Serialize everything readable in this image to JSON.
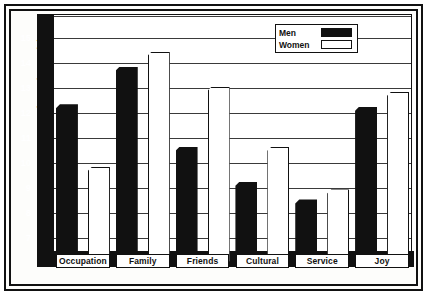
{
  "chart_data": {
    "type": "bar",
    "title": "",
    "xlabel": "",
    "ylabel": "Average Scores (21-point scale)",
    "categories": [
      "Occupation",
      "Family",
      "Friends",
      "Cultural",
      "Service",
      "Joy"
    ],
    "series": [
      {
        "name": "Men",
        "values": [
          12.3,
          13.8,
          10.6,
          9.2,
          8.5,
          12.2
        ]
      },
      {
        "name": "Women",
        "values": [
          9.8,
          14.4,
          13.0,
          10.6,
          8.9,
          12.8
        ]
      }
    ],
    "ylim": [
      6.2,
      15.9
    ],
    "yticks": [
      7,
      8,
      9,
      10,
      11,
      12,
      13,
      14,
      15
    ],
    "ytick_labels": [
      "7",
      "8",
      "9",
      "10",
      "11",
      "12",
      "13",
      "14",
      "15"
    ],
    "extra_gridlines": [
      15.85
    ],
    "grid": true,
    "legend_position": "top-right",
    "colors": {
      "men": "#111111",
      "women": "#ffffff",
      "outline": "#111111",
      "grid": "#3a3a3a",
      "background": "#ffffff"
    }
  },
  "legend": {
    "entries": [
      {
        "label": "Men",
        "style": "men"
      },
      {
        "label": "Women",
        "style": "women"
      }
    ]
  }
}
